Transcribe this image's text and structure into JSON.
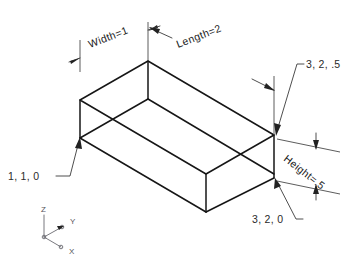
{
  "diagram": {
    "background_color": "#ffffff",
    "line_color": "#161616",
    "text_color": "#1a1a1a",
    "dimensions": [
      {
        "id": "width",
        "label": "Width=1",
        "value": 1,
        "rotation_deg": -21
      },
      {
        "id": "length",
        "label": "Length=2",
        "value": 2,
        "rotation_deg": -21
      },
      {
        "id": "height",
        "label": "Height=.5",
        "value": 0.5,
        "rotation_deg": 38
      }
    ],
    "coordinate_callouts": [
      {
        "id": "corner-origin",
        "label": "1, 1, 0"
      },
      {
        "id": "corner-top-far",
        "label": "3, 2, .5"
      },
      {
        "id": "corner-bottom-far",
        "label": "3, 2, 0"
      }
    ],
    "axis_triad": {
      "z_label": "Z",
      "y_label": "Y",
      "x_label": "X"
    }
  }
}
